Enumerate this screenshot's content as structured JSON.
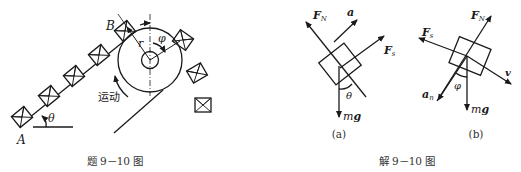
{
  "figure_left": {
    "caption": "题 9－10 图",
    "point_A": "A",
    "point_B": "B",
    "angle_theta": "θ",
    "radius": "r",
    "angle_phi": "φ",
    "motion_label": "运动"
  },
  "figure_right": {
    "caption": "解 9－10 图",
    "panel_a": {
      "label": "(a)",
      "normal_force": "F",
      "normal_force_sub": "N",
      "friction_force": "F",
      "friction_force_sub": "s",
      "acceleration": "a",
      "gravity_m": "m",
      "gravity_g": "g",
      "angle": "θ"
    },
    "panel_b": {
      "label": "(b)",
      "normal_force": "F",
      "normal_force_sub": "N",
      "friction_force": "F",
      "friction_force_sub": "s",
      "velocity": "v",
      "normal_accel": "a",
      "normal_accel_sub": "n",
      "gravity_m": "m",
      "gravity_g": "g",
      "angle": "φ"
    }
  }
}
